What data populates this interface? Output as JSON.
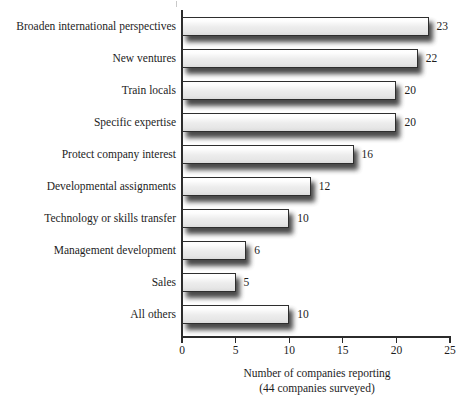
{
  "chart_data": {
    "type": "bar",
    "orientation": "horizontal",
    "title": "",
    "xlabel": "Number of companies reporting",
    "xlabel_sub": "(44 companies surveyed)",
    "ylabel": "",
    "categories": [
      "Broaden international perspectives",
      "New ventures",
      "Train locals",
      "Specific expertise",
      "Protect company interest",
      "Developmental assignments",
      "Technology or skills transfer",
      "Management development",
      "Sales",
      "All others"
    ],
    "values": [
      23,
      22,
      20,
      20,
      16,
      12,
      10,
      6,
      5,
      10
    ],
    "value_labels": [
      "23",
      "22",
      "20",
      "20",
      "16",
      "12",
      "10",
      "6",
      "5",
      "10"
    ],
    "xlim": [
      0,
      25
    ],
    "xticks": [
      0,
      5,
      10,
      15,
      20,
      25
    ],
    "xtick_labels": [
      "0",
      "5",
      "10",
      "15",
      "20",
      "25"
    ],
    "grid": false,
    "legend": false,
    "bar_fill": "#ededed",
    "bar_border": "#2e2e2e",
    "axis_color": "#2b2b2b",
    "text_color": "#1d1d1d",
    "background": "#ffffff"
  }
}
